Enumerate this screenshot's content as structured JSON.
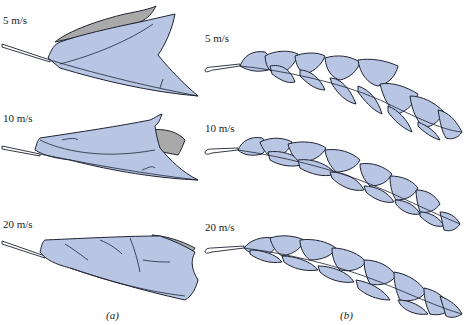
{
  "figure": {
    "panels": [
      {
        "id": "a",
        "caption": "(a)",
        "rows": [
          {
            "speed_label": "5 m/s"
          },
          {
            "speed_label": "10 m/s"
          },
          {
            "speed_label": "20 m/s"
          }
        ]
      },
      {
        "id": "b",
        "caption": "(b)",
        "rows": [
          {
            "speed_label": "5 m/s"
          },
          {
            "speed_label": "10 m/s"
          },
          {
            "speed_label": "20 m/s"
          }
        ]
      }
    ]
  },
  "colors": {
    "fill": "#b8c6e4",
    "fold": "#a9a9a9",
    "outline": "#1f2433",
    "background": "#ffffff"
  }
}
